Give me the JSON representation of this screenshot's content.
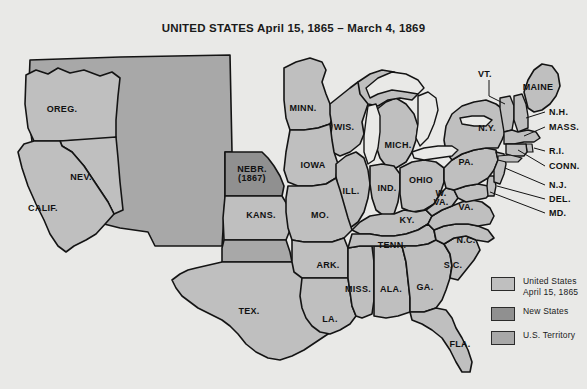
{
  "figure": {
    "title": "UNITED STATES April 15, 1865 – March 4, 1869",
    "background_color": "#e9e9e7",
    "outline_color": "#141414"
  },
  "colors": {
    "state_fill": "#bfbfbf",
    "new_state_fill": "#909090",
    "territory_fill": "#a8a8a8",
    "ocean_fill": "#e9e9e7",
    "border": "#141414"
  },
  "legend": {
    "items": [
      {
        "swatch_color": "#bfbfbf",
        "line1": "United States",
        "line2": "April 15, 1865"
      },
      {
        "swatch_color": "#909090",
        "line1": "New States",
        "line2": ""
      },
      {
        "swatch_color": "#a8a8a8",
        "line1": "U.S. Territory",
        "line2": ""
      }
    ]
  },
  "map": {
    "inline_labels": [
      {
        "name": "oregon",
        "text": "OREG.",
        "sub": "",
        "x": 62,
        "y": 110
      },
      {
        "name": "nevada",
        "text": "NEV.",
        "sub": "",
        "x": 81,
        "y": 178
      },
      {
        "name": "california",
        "text": "CALIF.",
        "sub": "",
        "x": 43,
        "y": 209
      },
      {
        "name": "nebraska",
        "text": "NEBR.",
        "sub": "(1867)",
        "x": 252,
        "y": 174
      },
      {
        "name": "kansas",
        "text": "KANS.",
        "sub": "",
        "x": 261,
        "y": 216
      },
      {
        "name": "texas",
        "text": "TEX.",
        "sub": "",
        "x": 249,
        "y": 312
      },
      {
        "name": "minnesota",
        "text": "MINN.",
        "sub": "",
        "x": 303,
        "y": 109
      },
      {
        "name": "wisconsin",
        "text": "WIS.",
        "sub": "",
        "x": 344,
        "y": 128
      },
      {
        "name": "iowa",
        "text": "IOWA",
        "sub": "",
        "x": 313,
        "y": 166
      },
      {
        "name": "michigan",
        "text": "MICH.",
        "sub": "",
        "x": 398,
        "y": 146
      },
      {
        "name": "illinois",
        "text": "ILL.",
        "sub": "",
        "x": 351,
        "y": 192
      },
      {
        "name": "indiana",
        "text": "IND.",
        "sub": "",
        "x": 387,
        "y": 189
      },
      {
        "name": "ohio",
        "text": "OHIO",
        "sub": "",
        "x": 421,
        "y": 181
      },
      {
        "name": "missouri",
        "text": "MO.",
        "sub": "",
        "x": 320,
        "y": 216
      },
      {
        "name": "kentucky",
        "text": "KY.",
        "sub": "",
        "x": 407,
        "y": 221
      },
      {
        "name": "arkansas",
        "text": "ARK.",
        "sub": "",
        "x": 328,
        "y": 266
      },
      {
        "name": "tennessee",
        "text": "TENN.",
        "sub": "",
        "x": 392,
        "y": 246
      },
      {
        "name": "mississippi",
        "text": "MISS.",
        "sub": "",
        "x": 358,
        "y": 290
      },
      {
        "name": "alabama",
        "text": "ALA.",
        "sub": "",
        "x": 391,
        "y": 290
      },
      {
        "name": "georgia",
        "text": "GA.",
        "sub": "",
        "x": 425,
        "y": 288
      },
      {
        "name": "louisiana",
        "text": "LA.",
        "sub": "",
        "x": 330,
        "y": 320
      },
      {
        "name": "florida",
        "text": "FLA.",
        "sub": "",
        "x": 460,
        "y": 345
      },
      {
        "name": "north-carolina",
        "text": "N.C.",
        "sub": "",
        "x": 466,
        "y": 241
      },
      {
        "name": "south-carolina",
        "text": "S.C.",
        "sub": "",
        "x": 453,
        "y": 266
      },
      {
        "name": "virginia",
        "text": "VA.",
        "sub": "",
        "x": 466,
        "y": 208
      },
      {
        "name": "west-virginia",
        "text": "W.",
        "sub": "VA.",
        "x": 441,
        "y": 198
      },
      {
        "name": "pennsylvania",
        "text": "PA.",
        "sub": "",
        "x": 466,
        "y": 163
      },
      {
        "name": "new-york",
        "text": "N.Y.",
        "sub": "",
        "x": 487,
        "y": 129
      },
      {
        "name": "maine",
        "text": "MAINE",
        "sub": "",
        "x": 538,
        "y": 88
      }
    ],
    "callout_labels": [
      {
        "name": "vermont",
        "text": "VT.",
        "x": 484,
        "y": 74
      },
      {
        "name": "new-hampshire",
        "text": "N.H.",
        "x": 549,
        "y": 112
      },
      {
        "name": "massachusetts",
        "text": "MASS.",
        "x": 549,
        "y": 127
      },
      {
        "name": "rhode-island",
        "text": "R.I.",
        "x": 549,
        "y": 151
      },
      {
        "name": "connecticut",
        "text": "CONN.",
        "x": 549,
        "y": 166
      },
      {
        "name": "new-jersey",
        "text": "N.J.",
        "x": 549,
        "y": 185
      },
      {
        "name": "delaware",
        "text": "DEL.",
        "x": 549,
        "y": 199
      },
      {
        "name": "maryland",
        "text": "MD.",
        "x": 549,
        "y": 213
      }
    ]
  }
}
